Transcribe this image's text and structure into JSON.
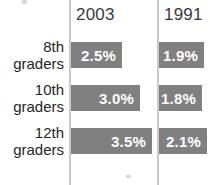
{
  "chart_data": {
    "type": "bar",
    "orientation": "horizontal",
    "title": "",
    "xlabel": "",
    "ylabel": "",
    "categories": [
      "8th graders",
      "10th graders",
      "12th graders"
    ],
    "category_lines": [
      [
        "8th",
        "graders"
      ],
      [
        "10th",
        "graders"
      ],
      [
        "12th",
        "graders"
      ]
    ],
    "series": [
      {
        "name": "2003",
        "values": [
          2.5,
          3.0,
          3.5
        ],
        "labels": [
          "2.5%",
          "3.0%",
          "3.5%"
        ]
      },
      {
        "name": "1991",
        "values": [
          1.9,
          1.8,
          2.1
        ],
        "labels": [
          "1.9%",
          "1.8%",
          "2.1%"
        ]
      }
    ],
    "unit": "%",
    "grid": false,
    "legend": "none",
    "bar_color": "#808080",
    "value_text_color": "#ffffff",
    "axis_color": "#c9c9c9",
    "background": "#ffffff"
  },
  "columns": {
    "col_2003_header": "2003",
    "col_1991_header": "1991"
  },
  "bar_geometry": {
    "series_2003_widths_px": [
      51,
      69,
      81
    ],
    "series_1991_widths_px": [
      45,
      43,
      48
    ]
  }
}
